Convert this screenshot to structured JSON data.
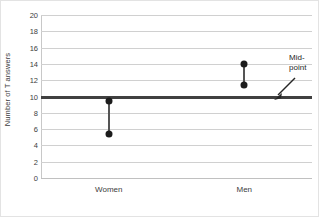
{
  "chart_data": {
    "type": "scatter",
    "title": "",
    "xlabel": "",
    "ylabel": "Number of T answers",
    "categories": [
      "Women",
      "Men"
    ],
    "ylim": [
      0,
      20
    ],
    "yticks": [
      20,
      18,
      16,
      14,
      12,
      10,
      8,
      6,
      4,
      2,
      0
    ],
    "grid": true,
    "legend": "none",
    "series": [
      {
        "name": "Upper value",
        "values": [
          9.4,
          14.0
        ]
      },
      {
        "name": "Lower value",
        "values": [
          5.4,
          11.4
        ]
      }
    ],
    "points": [
      {
        "category": "Women",
        "upper": 9.4,
        "lower": 5.4
      },
      {
        "category": "Men",
        "upper": 14.0,
        "lower": 11.4
      }
    ],
    "reference_line": {
      "value": 10,
      "label": "Mid-point"
    },
    "annotations": [
      {
        "text_line1": "Mid-",
        "text_line2": "point",
        "points_to_value": 10
      }
    ],
    "colors": {
      "marker": "#1c1c1c",
      "stem": "#555555",
      "gridline": "#d0d0d0",
      "reference_line": "#404040",
      "text": "#3d3d3d",
      "background": "#ffffff"
    }
  }
}
